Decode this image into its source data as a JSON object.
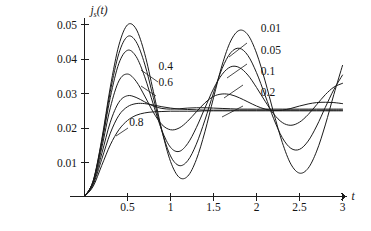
{
  "chart_data": {
    "type": "line",
    "title": "",
    "subtitle": "",
    "xlabel": "t",
    "ylabel": "j_s(t)",
    "ylabel_main": "j",
    "ylabel_subscript": "s",
    "ylabel_arg": "(t)",
    "xlim": [
      0,
      3.12
    ],
    "ylim": [
      0,
      0.0545
    ],
    "grid": false,
    "legend_position": "inline-annotations",
    "xticks": [
      0.5,
      1,
      1.5,
      2,
      2.5,
      3
    ],
    "xtick_labels": [
      "0.5",
      "1",
      "1.5",
      "2",
      "2.5",
      "3"
    ],
    "yticks": [
      0.01,
      0.02,
      0.03,
      0.04,
      0.05
    ],
    "ytick_labels": [
      "0.01",
      "0.02",
      "0.03",
      "0.04",
      "0.05"
    ],
    "steady_state": 0.025,
    "period": 1.0,
    "series": [
      {
        "name": "0.01",
        "damping": 0.01,
        "label_position": "right",
        "peak_t": 0.5,
        "peak_value": 0.0499,
        "values": [
          0,
          0.0045,
          0.0165,
          0.0318,
          0.044,
          0.0499,
          0.0487,
          0.0415,
          0.0306,
          0.0192,
          0.0102,
          0.0056,
          0.0059,
          0.0107,
          0.0188,
          0.0287,
          0.0382,
          0.0452,
          0.0483,
          0.047,
          0.0417,
          0.0336,
          0.0243,
          0.0157,
          0.0094,
          0.0068,
          0.0082,
          0.0132,
          0.0208,
          0.0297,
          0.0381
        ]
      },
      {
        "name": "0.05",
        "damping": 0.05,
        "label_position": "right",
        "peak_t": 0.5,
        "peak_value": 0.0465,
        "values": [
          0,
          0.0044,
          0.016,
          0.0305,
          0.0416,
          0.0465,
          0.045,
          0.0385,
          0.0288,
          0.019,
          0.0118,
          0.009,
          0.0104,
          0.0152,
          0.0222,
          0.0301,
          0.0372,
          0.0418,
          0.0431,
          0.041,
          0.036,
          0.0294,
          0.0226,
          0.0171,
          0.014,
          0.0137,
          0.0161,
          0.0205,
          0.0259,
          0.0311,
          0.0353
        ]
      },
      {
        "name": "0.1",
        "damping": 0.1,
        "label_position": "right",
        "peak_t": 0.5,
        "peak_value": 0.0425,
        "values": [
          0,
          0.0043,
          0.0153,
          0.0288,
          0.0387,
          0.0425,
          0.0407,
          0.0348,
          0.0268,
          0.0192,
          0.0143,
          0.0131,
          0.0154,
          0.02,
          0.0257,
          0.0313,
          0.0355,
          0.0377,
          0.0375,
          0.0353,
          0.0317,
          0.0277,
          0.024,
          0.0215,
          0.0207,
          0.0216,
          0.0238,
          0.0267,
          0.0296,
          0.0318,
          0.0329
        ]
      },
      {
        "name": "0.2",
        "damping": 0.2,
        "label_position": "right",
        "peak_t": 0.5,
        "peak_value": 0.0356,
        "values": [
          0,
          0.0041,
          0.0141,
          0.0258,
          0.0336,
          0.0356,
          0.0335,
          0.0292,
          0.0245,
          0.0209,
          0.0194,
          0.0199,
          0.0219,
          0.0246,
          0.0272,
          0.0291,
          0.0298,
          0.0296,
          0.0287,
          0.0275,
          0.0263,
          0.0254,
          0.025,
          0.0251,
          0.0256,
          0.0263,
          0.0269,
          0.0273,
          0.0274,
          0.0273,
          0.027
        ]
      },
      {
        "name": "0.4",
        "damping": 0.4,
        "label_position": "left",
        "peak_t": 0.47,
        "peak_value": 0.0295,
        "values": [
          0,
          0.0038,
          0.0124,
          0.0216,
          0.0274,
          0.0293,
          0.0288,
          0.0275,
          0.0263,
          0.0256,
          0.0254,
          0.0255,
          0.0257,
          0.0258,
          0.0258,
          0.0257,
          0.0256,
          0.0255,
          0.0254,
          0.0254,
          0.0254,
          0.0254,
          0.0254,
          0.0254,
          0.0254,
          0.0254,
          0.0254,
          0.0254,
          0.0254,
          0.0254,
          0.0254
        ]
      },
      {
        "name": "0.6",
        "damping": 0.6,
        "label_position": "left",
        "peak_t": 0.55,
        "peak_value": 0.0272,
        "values": [
          0,
          0.0034,
          0.0108,
          0.0184,
          0.0236,
          0.0261,
          0.027,
          0.027,
          0.0266,
          0.0261,
          0.0257,
          0.0254,
          0.0253,
          0.0252,
          0.0251,
          0.0251,
          0.0251,
          0.0251,
          0.0251,
          0.0251,
          0.0251,
          0.0251,
          0.0251,
          0.0251,
          0.0251,
          0.0251,
          0.0251,
          0.0251,
          0.0251,
          0.0251,
          0.0251
        ]
      },
      {
        "name": "0.8",
        "damping": 0.8,
        "label_position": "left",
        "peak_t": 0.75,
        "peak_value": 0.0248,
        "values": [
          0,
          0.0029,
          0.009,
          0.015,
          0.0194,
          0.0221,
          0.0236,
          0.0243,
          0.0246,
          0.0247,
          0.0248,
          0.0248,
          0.0248,
          0.0248,
          0.0249,
          0.0249,
          0.0249,
          0.0249,
          0.0249,
          0.0249,
          0.0249,
          0.0249,
          0.0249,
          0.0249,
          0.0249,
          0.0249,
          0.0249,
          0.0249,
          0.0249,
          0.0249,
          0.0249
        ]
      }
    ],
    "annotations": [
      {
        "text": "0.01",
        "x": 2.05,
        "y": 0.0478
      },
      {
        "text": "0.05",
        "x": 2.05,
        "y": 0.0415
      },
      {
        "text": "0.1",
        "x": 2.05,
        "y": 0.0352
      },
      {
        "text": "0.2",
        "x": 2.05,
        "y": 0.0292
      },
      {
        "text": "0.4",
        "x": 0.86,
        "y": 0.0368
      },
      {
        "text": "0.6",
        "x": 0.86,
        "y": 0.0322
      },
      {
        "text": "0.8",
        "x": 0.52,
        "y": 0.0205
      }
    ]
  }
}
